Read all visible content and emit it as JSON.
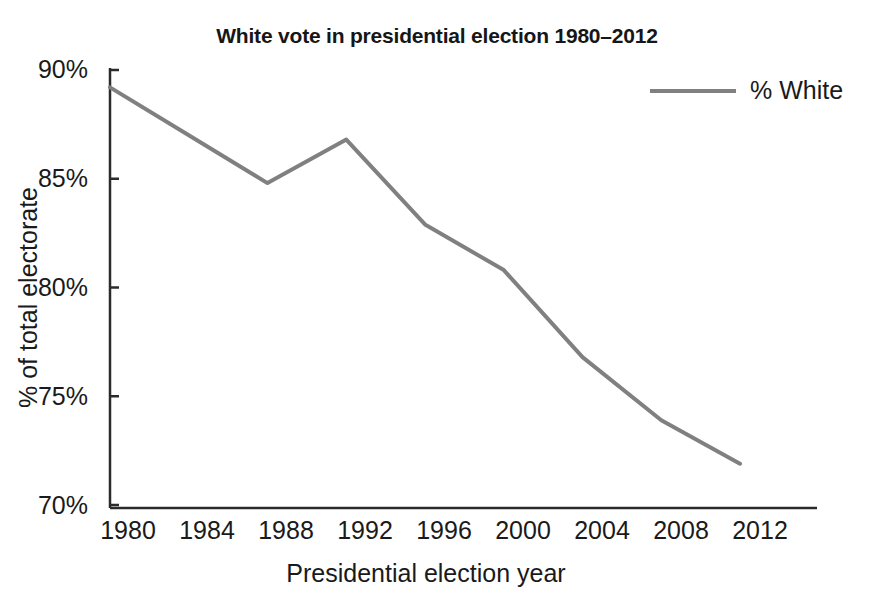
{
  "chart_data": {
    "type": "line",
    "title": "White vote in presidential election 1980–2012",
    "xlabel": "Presidential election year",
    "ylabel": "% of total electorate",
    "categories": [
      1980,
      1984,
      1988,
      1992,
      1996,
      2000,
      2004,
      2008,
      2012
    ],
    "xtick_labels": [
      "1980",
      "1984",
      "1988",
      "1992",
      "1996",
      "2000",
      "2004",
      "2008",
      "2012"
    ],
    "ytick_labels": [
      "90%",
      "85%",
      "80%",
      "75%",
      "70%"
    ],
    "ytick_values": [
      90,
      85,
      80,
      75,
      70
    ],
    "ylim": [
      70,
      90
    ],
    "xlim": [
      1980,
      2012
    ],
    "grid": false,
    "legend_position": "top-right",
    "series": [
      {
        "name": "% White",
        "color": "#808080",
        "values": [
          89.2,
          87.0,
          84.8,
          86.8,
          82.9,
          80.8,
          76.8,
          73.9,
          71.9
        ]
      }
    ]
  },
  "legend": {
    "entries": [
      {
        "label": "% White",
        "swatch": "line-swatch"
      }
    ]
  }
}
